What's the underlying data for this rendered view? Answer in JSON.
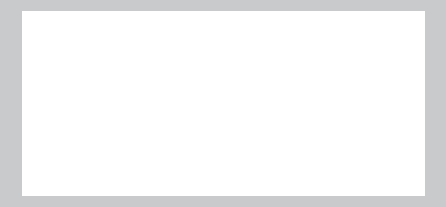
{
  "figure": {
    "background_color": "#c9cacb",
    "panel_color": "#ffffff",
    "circle_fill": "#f8f8f8",
    "circle_stroke": "#dddddd",
    "overlap_fill": "#dedede",
    "label_color": "#2b2b2b",
    "number_color": "#7d7d7d",
    "self_label": "Self",
    "other_label": "Other",
    "rows": [
      {
        "name": "top-row",
        "item_indices": [
          0,
          1,
          2
        ]
      },
      {
        "name": "bottom-row",
        "item_indices": [
          3,
          4,
          5,
          6
        ]
      }
    ],
    "items": [
      {
        "number": "1",
        "self_label": "Self",
        "other_label": "Other",
        "overlap_fraction": 0.0,
        "center_separation": 2.02,
        "radius": 27
      },
      {
        "number": "2",
        "self_label": "Self",
        "other_label": "Other",
        "overlap_fraction": 0.08,
        "center_separation": 1.84,
        "radius": 27
      },
      {
        "number": "3",
        "self_label": "Self",
        "other_label": "Other",
        "overlap_fraction": 0.2,
        "center_separation": 1.6,
        "radius": 27
      },
      {
        "number": "4",
        "self_label": "Self",
        "other_label": "Other",
        "overlap_fraction": 0.33,
        "center_separation": 1.35,
        "radius": 27
      },
      {
        "number": "5",
        "self_label": "Self",
        "other_label": "Other",
        "overlap_fraction": 0.48,
        "center_separation": 1.08,
        "radius": 27
      },
      {
        "number": "6",
        "self_label": "Self",
        "other_label": "Other",
        "overlap_fraction": 0.66,
        "center_separation": 0.74,
        "radius": 27
      },
      {
        "number": "7",
        "self_label": "Self",
        "other_label": "Other",
        "overlap_fraction": 0.9,
        "center_separation": 0.2,
        "radius": 27
      }
    ]
  },
  "chart_data": {
    "type": "diagram",
    "xlabel": "",
    "ylabel": "",
    "categories": [
      "1",
      "2",
      "3",
      "4",
      "5",
      "6",
      "7"
    ],
    "values": [
      0.0,
      0.08,
      0.2,
      0.33,
      0.48,
      0.66,
      0.9
    ],
    "series": [
      {
        "name": "overlap_fraction",
        "values": [
          0.0,
          0.08,
          0.2,
          0.33,
          0.48,
          0.66,
          0.9
        ]
      },
      {
        "name": "center_separation_in_radii",
        "values": [
          2.02,
          1.84,
          1.6,
          1.35,
          1.08,
          0.74,
          0.2
        ]
      }
    ],
    "legend": [
      "Self",
      "Other"
    ],
    "annotations": [
      "1",
      "2",
      "3",
      "4",
      "5",
      "6",
      "7"
    ],
    "grid": false,
    "legend_position": "inside-circles"
  }
}
